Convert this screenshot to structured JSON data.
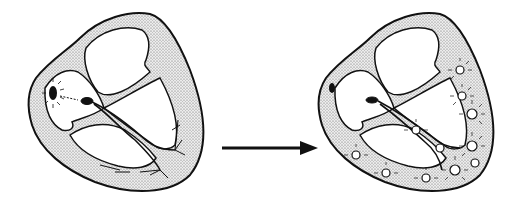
{
  "diagram": {
    "panels": [
      {
        "id": "left",
        "state": "impulse originating at sinoatrial node",
        "center_x": 110
      },
      {
        "id": "right",
        "state": "impulse spread through ventricular myocardium",
        "center_x": 400
      }
    ],
    "arrow": {
      "direction": "right",
      "from_x": 222,
      "to_x": 318,
      "y": 148
    },
    "colors": {
      "outline": "#111111",
      "wall_fill": "#d9d9d9",
      "chamber_fill": "#ffffff",
      "background": "#ffffff"
    }
  }
}
